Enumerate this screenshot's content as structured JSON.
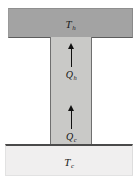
{
  "figure": {
    "background_color": "#ffffff"
  },
  "hot_block": {
    "label_symbol": "T",
    "label_subscript": "h",
    "fill_color": "#a3a3a3"
  },
  "cold_block": {
    "label_symbol": "T",
    "label_subscript": "c",
    "fill_color": "#f0efef"
  },
  "column": {
    "fill_color": "#c9c9c7",
    "edge_color": "#6f6f6f"
  },
  "flows": [
    {
      "name": "hot-heat-flow",
      "label_symbol": "Q",
      "label_subscript": "h",
      "direction": "up",
      "arrow_color": "#111111"
    },
    {
      "name": "cold-heat-flow",
      "label_symbol": "Q",
      "label_subscript": "c",
      "direction": "up",
      "arrow_color": "#111111"
    }
  ]
}
